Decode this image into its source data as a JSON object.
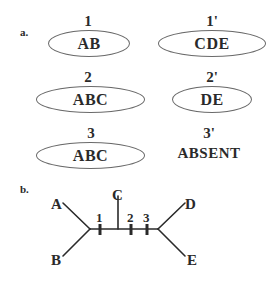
{
  "panel_a": {
    "label": "a.",
    "rows": [
      {
        "left": {
          "number": "1",
          "content": "AB"
        },
        "right": {
          "number": "1'",
          "content": "CDE"
        }
      },
      {
        "left": {
          "number": "2",
          "content": "ABC"
        },
        "right": {
          "number": "2'",
          "content": "DE"
        }
      },
      {
        "left": {
          "number": "3",
          "content": "ABC"
        },
        "right": {
          "number": "3'",
          "content": "ABSENT",
          "enclosed": false
        }
      }
    ]
  },
  "panel_b": {
    "label": "b.",
    "tree": {
      "taxa": [
        "A",
        "B",
        "C",
        "D",
        "E"
      ],
      "branch_marks": [
        "1",
        "2",
        "3"
      ]
    }
  }
}
